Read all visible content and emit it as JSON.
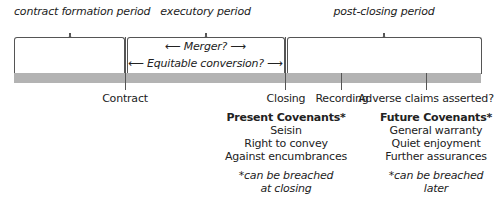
{
  "periods": [
    {
      "id": "contract-formation",
      "label": "contract formation period"
    },
    {
      "id": "executory",
      "label": "executory period"
    },
    {
      "id": "post-closing",
      "label": "post-closing period"
    }
  ],
  "executory_notes": {
    "merger": "Merger?",
    "equitable_conversion": "Equitable conversion?",
    "arrow_left": "⟵",
    "arrow_right": "⟶"
  },
  "timeline_events": [
    {
      "id": "contract",
      "label": "Contract"
    },
    {
      "id": "closing",
      "label": "Closing"
    },
    {
      "id": "recording",
      "label": "Recording"
    },
    {
      "id": "adverse-claims",
      "label": "Adverse claims asserted?"
    }
  ],
  "covenants": {
    "present": {
      "title": "Present Covenants*",
      "items": [
        "Seisin",
        "Right to convey",
        "Against encumbrances"
      ],
      "note_line1": "*can be breached",
      "note_line2": "at closing"
    },
    "future": {
      "title": "Future Covenants*",
      "items": [
        "General warranty",
        "Quiet enjoyment",
        "Further assurances"
      ],
      "note_line1": "*can be breached",
      "note_line2": "later"
    }
  },
  "colors": {
    "bar": "#b3b3b3",
    "lines": "#555555",
    "text": "#222222"
  }
}
